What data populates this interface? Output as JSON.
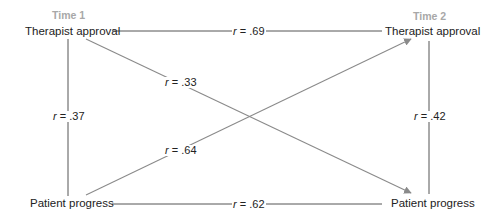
{
  "diagram": {
    "type": "cross-lagged panel",
    "colors": {
      "line": "#8a8a8a",
      "text": "#222222",
      "time_label": "#a8a8a8"
    },
    "time_labels": {
      "left": "Time 1",
      "right": "Time 2"
    },
    "nodes": {
      "t1_therapist": "Therapist approval",
      "t1_patient": "Patient progress",
      "t2_therapist": "Therapist approval",
      "t2_patient": "Patient progress"
    },
    "edges": [
      {
        "from": "t1_therapist",
        "to": "t2_therapist",
        "r_symbol": "r",
        "eq": " = ",
        "value": ".69",
        "arrow": false
      },
      {
        "from": "t1_patient",
        "to": "t2_patient",
        "r_symbol": "r",
        "eq": " = ",
        "value": ".62",
        "arrow": false
      },
      {
        "from": "t1_therapist",
        "to": "t1_patient",
        "r_symbol": "r",
        "eq": " = ",
        "value": ".37",
        "arrow": false
      },
      {
        "from": "t2_therapist",
        "to": "t2_patient",
        "r_symbol": "r",
        "eq": " = ",
        "value": ".42",
        "arrow": false
      },
      {
        "from": "t1_therapist",
        "to": "t2_patient",
        "r_symbol": "r",
        "eq": " = ",
        "value": ".33",
        "arrow": true
      },
      {
        "from": "t1_patient",
        "to": "t2_therapist",
        "r_symbol": "r",
        "eq": " = ",
        "value": ".64",
        "arrow": true
      }
    ]
  }
}
